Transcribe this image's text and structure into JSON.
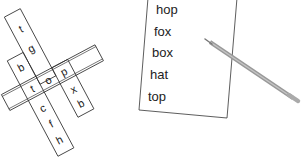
{
  "crossword": {
    "across": {
      "cells": [
        "t",
        "o",
        "p"
      ]
    },
    "down_left": {
      "cells": [
        "b",
        "t",
        "c",
        "f",
        "h"
      ]
    },
    "down_middle": {
      "cells": [
        "t",
        "g",
        "o"
      ]
    },
    "down_right": {
      "cells": [
        "p",
        "x",
        "b"
      ]
    }
  },
  "word_list": {
    "words": [
      "hop",
      "fox",
      "box",
      "hat",
      "top"
    ]
  },
  "pencil": {
    "icon": "pencil-icon"
  }
}
